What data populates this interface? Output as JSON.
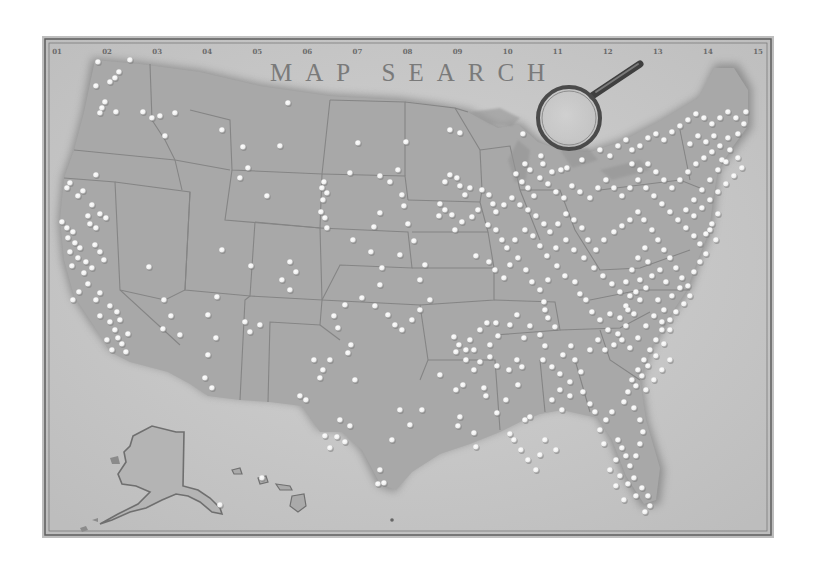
{
  "title": "MAP SEARCH",
  "column_labels": [
    "01",
    "02",
    "03",
    "04",
    "05",
    "06",
    "07",
    "08",
    "09",
    "10",
    "11",
    "12",
    "13",
    "14",
    "15"
  ],
  "colors": {
    "paper": "#c9c9c9",
    "paper_light": "#d8d8d8",
    "land": "#a9a9a9",
    "land_shadow": "#8a8a8a",
    "border_line": "#7c7c7c",
    "frame_line": "#5a5a5a",
    "dot": "#f4f4f4",
    "dot_shadow": "#7a7a7a",
    "title": "#7a7a7a"
  },
  "magnifier": {
    "cx": 569,
    "cy": 118,
    "r": 31,
    "handle_to": [
      645,
      63
    ]
  },
  "regions": [
    "contiguous-us",
    "alaska",
    "hawaii"
  ],
  "dots": [
    [
      98,
      62
    ],
    [
      119,
      72
    ],
    [
      115,
      78
    ],
    [
      110,
      82
    ],
    [
      96,
      86
    ],
    [
      130,
      60
    ],
    [
      105,
      102
    ],
    [
      102,
      108
    ],
    [
      100,
      113
    ],
    [
      116,
      112
    ],
    [
      143,
      112
    ],
    [
      152,
      118
    ],
    [
      160,
      116
    ],
    [
      175,
      113
    ],
    [
      165,
      136
    ],
    [
      96,
      175
    ],
    [
      70,
      183
    ],
    [
      67,
      188
    ],
    [
      83,
      191
    ],
    [
      78,
      196
    ],
    [
      92,
      205
    ],
    [
      100,
      214
    ],
    [
      106,
      218
    ],
    [
      88,
      216
    ],
    [
      90,
      224
    ],
    [
      96,
      228
    ],
    [
      62,
      222
    ],
    [
      67,
      228
    ],
    [
      73,
      232
    ],
    [
      68,
      238
    ],
    [
      75,
      243
    ],
    [
      80,
      248
    ],
    [
      70,
      252
    ],
    [
      78,
      258
    ],
    [
      86,
      262
    ],
    [
      92,
      268
    ],
    [
      84,
      273
    ],
    [
      72,
      266
    ],
    [
      95,
      245
    ],
    [
      100,
      252
    ],
    [
      104,
      260
    ],
    [
      88,
      284
    ],
    [
      79,
      292
    ],
    [
      73,
      300
    ],
    [
      96,
      300
    ],
    [
      100,
      293
    ],
    [
      110,
      306
    ],
    [
      117,
      312
    ],
    [
      120,
      320
    ],
    [
      110,
      322
    ],
    [
      115,
      330
    ],
    [
      118,
      338
    ],
    [
      122,
      344
    ],
    [
      107,
      340
    ],
    [
      100,
      316
    ],
    [
      128,
      334
    ],
    [
      126,
      352
    ],
    [
      112,
      350
    ],
    [
      164,
      300
    ],
    [
      171,
      316
    ],
    [
      163,
      329
    ],
    [
      149,
      267
    ],
    [
      180,
      335
    ],
    [
      248,
      168
    ],
    [
      243,
      147
    ],
    [
      222,
      130
    ],
    [
      288,
      103
    ],
    [
      280,
      146
    ],
    [
      240,
      178
    ],
    [
      267,
      196
    ],
    [
      222,
      250
    ],
    [
      251,
      266
    ],
    [
      290,
      262
    ],
    [
      296,
      272
    ],
    [
      282,
      280
    ],
    [
      290,
      290
    ],
    [
      217,
      297
    ],
    [
      208,
      315
    ],
    [
      245,
      322
    ],
    [
      250,
      332
    ],
    [
      260,
      325
    ],
    [
      216,
      338
    ],
    [
      208,
      355
    ],
    [
      205,
      378
    ],
    [
      212,
      388
    ],
    [
      324,
      182
    ],
    [
      322,
      188
    ],
    [
      327,
      193
    ],
    [
      323,
      200
    ],
    [
      321,
      212
    ],
    [
      325,
      218
    ],
    [
      327,
      228
    ],
    [
      350,
      173
    ],
    [
      358,
      143
    ],
    [
      380,
      176
    ],
    [
      406,
      142
    ],
    [
      390,
      182
    ],
    [
      402,
      195
    ],
    [
      404,
      206
    ],
    [
      398,
      170
    ],
    [
      380,
      213
    ],
    [
      353,
      240
    ],
    [
      374,
      227
    ],
    [
      371,
      252
    ],
    [
      400,
      255
    ],
    [
      382,
      268
    ],
    [
      380,
      285
    ],
    [
      420,
      280
    ],
    [
      425,
      265
    ],
    [
      414,
      241
    ],
    [
      408,
      224
    ],
    [
      450,
      130
    ],
    [
      460,
      133
    ],
    [
      445,
      182
    ],
    [
      450,
      175
    ],
    [
      457,
      178
    ],
    [
      460,
      186
    ],
    [
      470,
      188
    ],
    [
      465,
      195
    ],
    [
      440,
      204
    ],
    [
      445,
      210
    ],
    [
      452,
      215
    ],
    [
      472,
      217
    ],
    [
      478,
      210
    ],
    [
      462,
      222
    ],
    [
      455,
      230
    ],
    [
      439,
      216
    ],
    [
      430,
      300
    ],
    [
      420,
      310
    ],
    [
      412,
      320
    ],
    [
      402,
      330
    ],
    [
      395,
      325
    ],
    [
      388,
      315
    ],
    [
      375,
      306
    ],
    [
      362,
      298
    ],
    [
      345,
      305
    ],
    [
      334,
      316
    ],
    [
      338,
      328
    ],
    [
      351,
      345
    ],
    [
      348,
      353
    ],
    [
      323,
      370
    ],
    [
      330,
      360
    ],
    [
      355,
      380
    ],
    [
      314,
      360
    ],
    [
      320,
      378
    ],
    [
      300,
      396
    ],
    [
      306,
      400
    ],
    [
      340,
      420
    ],
    [
      345,
      442
    ],
    [
      330,
      448
    ],
    [
      325,
      436
    ],
    [
      337,
      437
    ],
    [
      350,
      426
    ],
    [
      380,
      470
    ],
    [
      378,
      484
    ],
    [
      384,
      483
    ],
    [
      392,
      440
    ],
    [
      400,
      410
    ],
    [
      410,
      425
    ],
    [
      422,
      410
    ],
    [
      440,
      375
    ],
    [
      456,
      390
    ],
    [
      463,
      385
    ],
    [
      454,
      337
    ],
    [
      459,
      345
    ],
    [
      456,
      352
    ],
    [
      466,
      360
    ],
    [
      474,
      370
    ],
    [
      480,
      362
    ],
    [
      474,
      350
    ],
    [
      470,
      340
    ],
    [
      490,
      345
    ],
    [
      490,
      357
    ],
    [
      497,
      366
    ],
    [
      509,
      370
    ],
    [
      517,
      360
    ],
    [
      522,
      367
    ],
    [
      518,
      385
    ],
    [
      484,
      388
    ],
    [
      486,
      396
    ],
    [
      506,
      400
    ],
    [
      497,
      413
    ],
    [
      458,
      426
    ],
    [
      460,
      417
    ],
    [
      474,
      433
    ],
    [
      510,
      434
    ],
    [
      514,
      440
    ],
    [
      476,
      447
    ],
    [
      521,
      450
    ],
    [
      525,
      420
    ],
    [
      530,
      417
    ],
    [
      466,
      350
    ],
    [
      480,
      330
    ],
    [
      487,
      323
    ],
    [
      498,
      336
    ],
    [
      496,
      323
    ],
    [
      510,
      325
    ],
    [
      517,
      315
    ],
    [
      524,
      338
    ],
    [
      530,
      326
    ],
    [
      540,
      335
    ],
    [
      545,
      310
    ],
    [
      548,
      318
    ],
    [
      555,
      327
    ],
    [
      545,
      346
    ],
    [
      543,
      360
    ],
    [
      552,
      367
    ],
    [
      560,
      374
    ],
    [
      563,
      355
    ],
    [
      571,
      346
    ],
    [
      575,
      360
    ],
    [
      581,
      372
    ],
    [
      570,
      382
    ],
    [
      560,
      390
    ],
    [
      552,
      400
    ],
    [
      562,
      410
    ],
    [
      570,
      396
    ],
    [
      583,
      392
    ],
    [
      590,
      404
    ],
    [
      595,
      412
    ],
    [
      476,
      256
    ],
    [
      489,
      262
    ],
    [
      495,
      270
    ],
    [
      504,
      278
    ],
    [
      510,
      265
    ],
    [
      518,
      258
    ],
    [
      526,
      270
    ],
    [
      532,
      282
    ],
    [
      540,
      290
    ],
    [
      544,
      302
    ],
    [
      548,
      280
    ],
    [
      557,
      266
    ],
    [
      565,
      276
    ],
    [
      575,
      282
    ],
    [
      580,
      294
    ],
    [
      586,
      300
    ],
    [
      592,
      312
    ],
    [
      600,
      320
    ],
    [
      608,
      330
    ],
    [
      598,
      340
    ],
    [
      590,
      350
    ],
    [
      605,
      350
    ],
    [
      614,
      345
    ],
    [
      618,
      334
    ],
    [
      610,
      314
    ],
    [
      620,
      318
    ],
    [
      626,
      306
    ],
    [
      630,
      296
    ],
    [
      488,
      225
    ],
    [
      496,
      230
    ],
    [
      502,
      240
    ],
    [
      507,
      248
    ],
    [
      515,
      240
    ],
    [
      525,
      230
    ],
    [
      533,
      236
    ],
    [
      540,
      246
    ],
    [
      547,
      256
    ],
    [
      556,
      248
    ],
    [
      566,
      240
    ],
    [
      574,
      250
    ],
    [
      584,
      258
    ],
    [
      594,
      268
    ],
    [
      603,
      276
    ],
    [
      612,
      284
    ],
    [
      620,
      292
    ],
    [
      626,
      282
    ],
    [
      632,
      270
    ],
    [
      638,
      258
    ],
    [
      645,
      248
    ],
    [
      648,
      262
    ],
    [
      640,
      280
    ],
    [
      636,
      292
    ],
    [
      628,
      310
    ],
    [
      482,
      190
    ],
    [
      489,
      195
    ],
    [
      493,
      204
    ],
    [
      496,
      212
    ],
    [
      504,
      205
    ],
    [
      512,
      198
    ],
    [
      520,
      205
    ],
    [
      528,
      210
    ],
    [
      536,
      216
    ],
    [
      544,
      224
    ],
    [
      550,
      232
    ],
    [
      558,
      224
    ],
    [
      566,
      214
    ],
    [
      574,
      220
    ],
    [
      582,
      228
    ],
    [
      588,
      240
    ],
    [
      596,
      250
    ],
    [
      604,
      240
    ],
    [
      614,
      232
    ],
    [
      622,
      226
    ],
    [
      630,
      220
    ],
    [
      638,
      212
    ],
    [
      644,
      220
    ],
    [
      652,
      230
    ],
    [
      658,
      240
    ],
    [
      664,
      250
    ],
    [
      670,
      258
    ],
    [
      676,
      268
    ],
    [
      682,
      278
    ],
    [
      688,
      286
    ],
    [
      516,
      174
    ],
    [
      522,
      182
    ],
    [
      528,
      188
    ],
    [
      534,
      196
    ],
    [
      540,
      178
    ],
    [
      548,
      184
    ],
    [
      556,
      192
    ],
    [
      564,
      198
    ],
    [
      572,
      186
    ],
    [
      580,
      192
    ],
    [
      590,
      198
    ],
    [
      598,
      188
    ],
    [
      606,
      180
    ],
    [
      614,
      188
    ],
    [
      622,
      196
    ],
    [
      630,
      188
    ],
    [
      638,
      180
    ],
    [
      646,
      188
    ],
    [
      654,
      196
    ],
    [
      662,
      204
    ],
    [
      670,
      212
    ],
    [
      678,
      220
    ],
    [
      686,
      228
    ],
    [
      694,
      236
    ],
    [
      700,
      244
    ],
    [
      706,
      234
    ],
    [
      712,
      224
    ],
    [
      718,
      214
    ],
    [
      523,
      134
    ],
    [
      541,
      156
    ],
    [
      543,
      164
    ],
    [
      525,
      164
    ],
    [
      530,
      170
    ],
    [
      552,
      172
    ],
    [
      561,
      170
    ],
    [
      567,
      168
    ],
    [
      582,
      160
    ],
    [
      600,
      150
    ],
    [
      610,
      156
    ],
    [
      618,
      146
    ],
    [
      626,
      140
    ],
    [
      632,
      150
    ],
    [
      640,
      146
    ],
    [
      648,
      138
    ],
    [
      656,
      134
    ],
    [
      664,
      140
    ],
    [
      672,
      132
    ],
    [
      680,
      126
    ],
    [
      688,
      120
    ],
    [
      696,
      114
    ],
    [
      704,
      118
    ],
    [
      712,
      124
    ],
    [
      720,
      118
    ],
    [
      728,
      112
    ],
    [
      736,
      118
    ],
    [
      744,
      124
    ],
    [
      746,
      112
    ],
    [
      738,
      134
    ],
    [
      728,
      138
    ],
    [
      720,
      146
    ],
    [
      712,
      152
    ],
    [
      704,
      158
    ],
    [
      696,
      164
    ],
    [
      688,
      172
    ],
    [
      680,
      180
    ],
    [
      672,
      188
    ],
    [
      664,
      180
    ],
    [
      656,
      172
    ],
    [
      648,
      164
    ],
    [
      640,
      170
    ],
    [
      632,
      164
    ],
    [
      690,
      144
    ],
    [
      698,
      136
    ],
    [
      706,
      142
    ],
    [
      714,
      136
    ],
    [
      722,
      160
    ],
    [
      730,
      150
    ],
    [
      738,
      158
    ],
    [
      742,
      168
    ],
    [
      734,
      176
    ],
    [
      726,
      184
    ],
    [
      718,
      192
    ],
    [
      710,
      200
    ],
    [
      702,
      208
    ],
    [
      694,
      216
    ],
    [
      686,
      210
    ],
    [
      694,
      200
    ],
    [
      702,
      190
    ],
    [
      710,
      180
    ],
    [
      718,
      170
    ],
    [
      726,
      162
    ],
    [
      710,
      230
    ],
    [
      716,
      240
    ],
    [
      706,
      254
    ],
    [
      700,
      262
    ],
    [
      694,
      272
    ],
    [
      690,
      296
    ],
    [
      684,
      304
    ],
    [
      676,
      312
    ],
    [
      670,
      320
    ],
    [
      662,
      330
    ],
    [
      656,
      340
    ],
    [
      650,
      350
    ],
    [
      644,
      360
    ],
    [
      638,
      370
    ],
    [
      632,
      380
    ],
    [
      628,
      392
    ],
    [
      624,
      402
    ],
    [
      634,
      408
    ],
    [
      640,
      420
    ],
    [
      643,
      432
    ],
    [
      640,
      444
    ],
    [
      636,
      456
    ],
    [
      630,
      466
    ],
    [
      634,
      478
    ],
    [
      642,
      488
    ],
    [
      648,
      496
    ],
    [
      650,
      506
    ],
    [
      645,
      512
    ],
    [
      618,
      440
    ],
    [
      622,
      448
    ],
    [
      626,
      456
    ],
    [
      616,
      460
    ],
    [
      610,
      470
    ],
    [
      620,
      476
    ],
    [
      628,
      484
    ],
    [
      616,
      486
    ],
    [
      636,
      496
    ],
    [
      624,
      500
    ],
    [
      612,
      412
    ],
    [
      606,
      420
    ],
    [
      600,
      430
    ],
    [
      604,
      444
    ],
    [
      658,
      300
    ],
    [
      664,
      310
    ],
    [
      672,
      296
    ],
    [
      680,
      288
    ],
    [
      666,
      282
    ],
    [
      660,
      270
    ],
    [
      652,
      276
    ],
    [
      646,
      288
    ],
    [
      640,
      300
    ],
    [
      634,
      314
    ],
    [
      626,
      326
    ],
    [
      622,
      340
    ],
    [
      630,
      348
    ],
    [
      638,
      338
    ],
    [
      646,
      326
    ],
    [
      654,
      316
    ],
    [
      662,
      322
    ],
    [
      670,
      330
    ],
    [
      664,
      344
    ],
    [
      656,
      356
    ],
    [
      648,
      366
    ],
    [
      642,
      376
    ],
    [
      636,
      386
    ],
    [
      646,
      390
    ],
    [
      654,
      380
    ],
    [
      662,
      370
    ],
    [
      670,
      360
    ],
    [
      536,
      470
    ],
    [
      545,
      440
    ],
    [
      556,
      450
    ],
    [
      540,
      455
    ],
    [
      528,
      460
    ],
    [
      220,
      505
    ]
  ],
  "alaska_dots": [],
  "hawaii_dots": [
    [
      262,
      478
    ]
  ]
}
